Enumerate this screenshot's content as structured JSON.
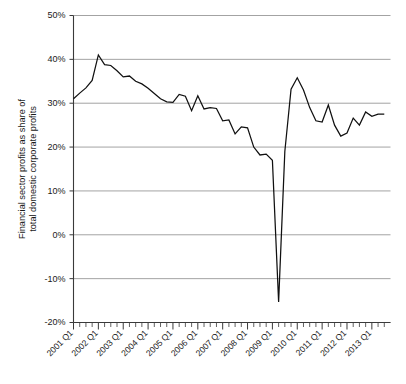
{
  "chart_data": {
    "type": "line",
    "title": "",
    "xlabel": "",
    "ylabel": "Financial sector profits as share of total domestic corporate profits",
    "ylabel_line1": "Financial sector profits as share of",
    "ylabel_line2": "total domestic corporate profits",
    "ylim": [
      -20,
      50
    ],
    "ytick_values": [
      50,
      40,
      30,
      20,
      10,
      0,
      -10,
      -20
    ],
    "ytick_labels": [
      "50%",
      "40%",
      "30%",
      "20%",
      "10%",
      "0%",
      "-10%",
      "-20%"
    ],
    "xtick_labels": [
      "2001 Q1",
      "2002 Q1",
      "2003 Q1",
      "2004 Q1",
      "2005 Q1",
      "2006 Q1",
      "2007 Q1",
      "2008 Q1",
      "2009 Q1",
      "2010 Q1",
      "2011 Q1",
      "2012 Q1",
      "2013 Q1"
    ],
    "xtick_label_rotation": -45,
    "grid": "horizontal",
    "legend": "none",
    "line_color": "#101010",
    "grid_color": "#8c8c8c",
    "background_color": "#ffffff",
    "x_period_labels": [
      "2001 Q1",
      "2001 Q2",
      "2001 Q3",
      "2001 Q4",
      "2002 Q1",
      "2002 Q2",
      "2002 Q3",
      "2002 Q4",
      "2003 Q1",
      "2003 Q2",
      "2003 Q3",
      "2003 Q4",
      "2004 Q1",
      "2004 Q2",
      "2004 Q3",
      "2004 Q4",
      "2005 Q1",
      "2005 Q2",
      "2005 Q3",
      "2005 Q4",
      "2006 Q1",
      "2006 Q2",
      "2006 Q3",
      "2006 Q4",
      "2007 Q1",
      "2007 Q2",
      "2007 Q3",
      "2007 Q4",
      "2008 Q1",
      "2008 Q2",
      "2008 Q3",
      "2008 Q4",
      "2009 Q1",
      "2009 Q2",
      "2009 Q3",
      "2009 Q4",
      "2010 Q1",
      "2010 Q2",
      "2010 Q3",
      "2010 Q4",
      "2011 Q1",
      "2011 Q2",
      "2011 Q3",
      "2011 Q4",
      "2012 Q1",
      "2012 Q2",
      "2012 Q3",
      "2012 Q4",
      "2013 Q1",
      "2013 Q2",
      "2013 Q3"
    ],
    "values": [
      31.0,
      32.3,
      33.5,
      35.2,
      41.0,
      38.8,
      38.6,
      37.4,
      36.0,
      36.2,
      35.0,
      34.4,
      33.4,
      32.2,
      31.0,
      30.3,
      30.2,
      32.0,
      31.6,
      28.3,
      31.7,
      28.7,
      29.0,
      28.8,
      26.0,
      26.2,
      23.0,
      24.6,
      24.4,
      20.0,
      18.2,
      18.4,
      17.0,
      -15.3,
      19.0,
      33.2,
      35.8,
      33.0,
      29.0,
      26.0,
      25.7,
      29.6,
      25.0,
      22.5,
      23.2,
      26.6,
      25.0,
      28.0,
      27.0,
      27.5,
      27.5
    ]
  }
}
